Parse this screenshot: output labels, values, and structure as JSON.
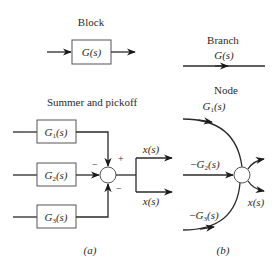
{
  "panel_a": {
    "caption": "(a)",
    "block": {
      "title": "Block",
      "transfer": "G(s)"
    },
    "summer_pickoff": {
      "title": "Summer and pickoff",
      "blocks": [
        "G1(s)",
        "G2(s)",
        "G3(s)"
      ],
      "block_labels": [
        {
          "main": "G",
          "sub": "1",
          "tail": "(s)"
        },
        {
          "main": "G",
          "sub": "2",
          "tail": "(s)"
        },
        {
          "main": "G",
          "sub": "3",
          "tail": "(s)"
        }
      ],
      "signs": {
        "top": "+",
        "left": "−",
        "bottom": "−"
      },
      "outputs": [
        "x(s)",
        "x(s)"
      ]
    }
  },
  "panel_b": {
    "caption": "(b)",
    "branch": {
      "title": "Branch",
      "transfer": "G(s)"
    },
    "node": {
      "title": "Node",
      "inputs": [
        {
          "main": "G",
          "sub": "1",
          "tail": "(s)",
          "prefix": ""
        },
        {
          "main": "G",
          "sub": "2",
          "tail": "(s)",
          "prefix": "−"
        },
        {
          "main": "G",
          "sub": "3",
          "tail": "(s)",
          "prefix": "−"
        }
      ],
      "output": "x(s)"
    }
  }
}
